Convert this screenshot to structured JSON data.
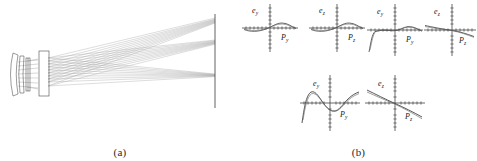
{
  "figure": {
    "panels": [
      {
        "id": "a",
        "caption": "(a)",
        "type": "optical-ray-diagram",
        "description": "Lens system ray trace to image plane"
      },
      {
        "id": "b",
        "caption": "(b)",
        "type": "aberration-plots",
        "description": "Transverse ray aberration fans"
      }
    ]
  },
  "optics": {
    "elements": [
      {
        "name": "front-lens-group",
        "label": ""
      },
      {
        "name": "middle-lens-group",
        "label": ""
      },
      {
        "name": "rear-lens-group",
        "label": ""
      },
      {
        "name": "image-plane",
        "label": ""
      }
    ],
    "ray_bundles": [
      {
        "name": "upper-field-bundle",
        "focus_y": 18
      },
      {
        "name": "mid-field-bundle",
        "focus_y": 42
      },
      {
        "name": "axial-bundle",
        "focus_y": 75
      }
    ]
  },
  "plots": [
    {
      "name": "plot-ey-py-row1-left",
      "y_axis_label": "e",
      "y_axis_sub": "y",
      "x_axis_label": "P",
      "x_axis_sub": "y",
      "curve_kind": "small-sine",
      "ticks_x": 13,
      "ticks_y": 11
    },
    {
      "name": "plot-ez-pz-row1-left",
      "y_axis_label": "e",
      "y_axis_sub": "z",
      "x_axis_label": "P",
      "x_axis_sub": "z",
      "curve_kind": "small-sine",
      "ticks_x": 13,
      "ticks_y": 11
    },
    {
      "name": "plot-ey-py-row1-right",
      "y_axis_label": "e",
      "y_axis_sub": "y",
      "x_axis_label": "P",
      "x_axis_sub": "y",
      "curve_kind": "dropping-left-hump",
      "ticks_x": 13,
      "ticks_y": 11
    },
    {
      "name": "plot-ez-pz-row1-right",
      "y_axis_label": "e",
      "y_axis_sub": "z",
      "x_axis_label": "P",
      "x_axis_sub": "z",
      "curve_kind": "shallow-descending",
      "ticks_x": 13,
      "ticks_y": 11
    },
    {
      "name": "plot-ey-py-row2",
      "y_axis_label": "e",
      "y_axis_sub": "y",
      "x_axis_label": "P",
      "x_axis_sub": "y",
      "curve_kind": "large-s-wave",
      "ticks_x": 13,
      "ticks_y": 11
    },
    {
      "name": "plot-ez-pz-row2",
      "y_axis_label": "e",
      "y_axis_sub": "z",
      "x_axis_label": "P",
      "x_axis_sub": "z",
      "curve_kind": "steep-descending",
      "ticks_x": 13,
      "ticks_y": 11
    }
  ],
  "colors": {
    "ink": "#1a1a1a",
    "ray": "#9a9a9a",
    "ray_dark": "#6e6e6e",
    "axis": "#2b2b2b",
    "curve": "#3a3a3a",
    "background": "#ffffff"
  }
}
